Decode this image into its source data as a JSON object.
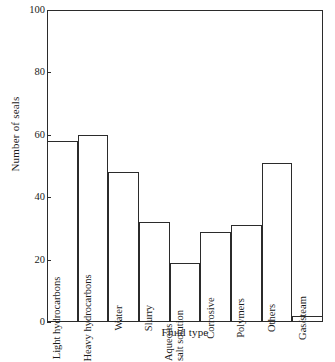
{
  "chart_data": {
    "type": "bar",
    "title": "",
    "xlabel": "Fluid type",
    "ylabel": "Number of seals",
    "categories": [
      "Light hydrocarbons",
      "Heavy hydrocarbons",
      "Water",
      "Slurry",
      "Aqueous salt solution",
      "Corrosive",
      "Polymers",
      "Others",
      "Gas/steam"
    ],
    "values": [
      58,
      60,
      48,
      32,
      19,
      29,
      31,
      51,
      2
    ],
    "ylim": [
      0,
      100
    ],
    "yticks": [
      0,
      20,
      40,
      60,
      80,
      100
    ],
    "ytick_labels": [
      "0",
      "20",
      "40",
      "60",
      "80",
      "100"
    ],
    "grid": false,
    "legend": "none",
    "bar_style": {
      "fill": "none",
      "edge_color": "#2b2b2b"
    }
  },
  "axis": {
    "y_title": "Number of seals",
    "x_title": "Fluid type"
  },
  "bar_label_lines": {
    "aqueous": [
      "Aqueous",
      "salt solution"
    ]
  }
}
